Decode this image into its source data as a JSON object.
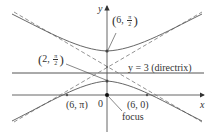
{
  "diagram": {
    "type": "conic-hyperbola-polar",
    "equation_context": "hyperbola with focus at origin and directrix y = 3",
    "axes": {
      "x_label": "x",
      "y_label": "y",
      "origin_label": "0"
    },
    "directrix": {
      "label": "y = 3 (directrix)",
      "y": 3
    },
    "focus": {
      "label": "focus",
      "point": [
        0,
        0
      ]
    },
    "points": [
      {
        "label_r": "6",
        "label_theta_num": "π",
        "label_theta_den": "2",
        "cartesian": [
          0,
          6
        ],
        "name": "upper-vertex"
      },
      {
        "label_r": "2",
        "label_theta_num": "π",
        "label_theta_den": "2",
        "cartesian": [
          0,
          2
        ],
        "name": "lower-vertex"
      },
      {
        "label": "(6, π)",
        "cartesian": [
          -6,
          0
        ],
        "name": "left-x-intercept"
      },
      {
        "label": "(6, 0)",
        "cartesian": [
          6,
          0
        ],
        "name": "right-x-intercept"
      }
    ],
    "colors": {
      "curve": "#555555",
      "axis": "#444444",
      "asymptote": "#777777",
      "text": "#333333"
    }
  },
  "labels": {
    "y_axis": "y",
    "x_axis": "x",
    "origin": "0",
    "upper_r": "6",
    "upper_num": "π",
    "upper_den": "2",
    "lower_r": "2",
    "lower_num": "π",
    "lower_den": "2",
    "left_point": "(6, π)",
    "right_point": "(6, 0)",
    "directrix": "y = 3 (directrix)",
    "focus": "focus"
  }
}
